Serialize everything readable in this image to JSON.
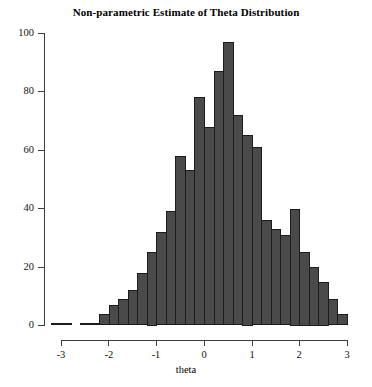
{
  "chart_data": {
    "type": "bar",
    "title": "Non-parametric Estimate of Theta Distribution",
    "xlabel": "theta",
    "ylabel": "",
    "xlim": [
      -3.2,
      3.2
    ],
    "ylim": [
      0,
      100
    ],
    "grid": false,
    "legend": null,
    "bin_width": 0.2,
    "xticks": [
      "-3",
      "-2",
      "-1",
      "0",
      "1",
      "2",
      "3"
    ],
    "xtick_values": [
      -3,
      -2,
      -1,
      0,
      1,
      2,
      3
    ],
    "yticks": [
      "0",
      "20",
      "40",
      "60",
      "80",
      "100"
    ],
    "ytick_values": [
      0,
      20,
      40,
      60,
      80,
      100
    ],
    "bin_centers": [
      -3.1,
      -2.9,
      -2.7,
      -2.5,
      -2.3,
      -2.1,
      -1.9,
      -1.7,
      -1.5,
      -1.3,
      -1.1,
      -0.9,
      -0.7,
      -0.5,
      -0.3,
      -0.1,
      0.1,
      0.3,
      0.5,
      0.7,
      0.9,
      1.1,
      1.3,
      1.5,
      1.7,
      1.9,
      2.1,
      2.3,
      2.5,
      2.7,
      2.9
    ],
    "categories": [
      "-3.1",
      "-2.9",
      "-2.7",
      "-2.5",
      "-2.3",
      "-2.1",
      "-1.9",
      "-1.7",
      "-1.5",
      "-1.3",
      "-1.1",
      "-0.9",
      "-0.7",
      "-0.5",
      "-0.3",
      "-0.1",
      "0.1",
      "0.3",
      "0.5",
      "0.7",
      "0.9",
      "1.1",
      "1.3",
      "1.5",
      "1.7",
      "1.9",
      "2.1",
      "2.3",
      "2.5",
      "2.7",
      "2.9"
    ],
    "values": [
      1,
      1,
      0,
      1,
      1,
      4,
      7,
      9,
      12,
      18,
      25,
      32,
      39,
      58,
      53,
      78,
      68,
      87,
      97,
      72,
      65,
      61,
      36,
      33,
      31,
      40,
      25,
      20,
      15,
      9,
      4
    ]
  }
}
